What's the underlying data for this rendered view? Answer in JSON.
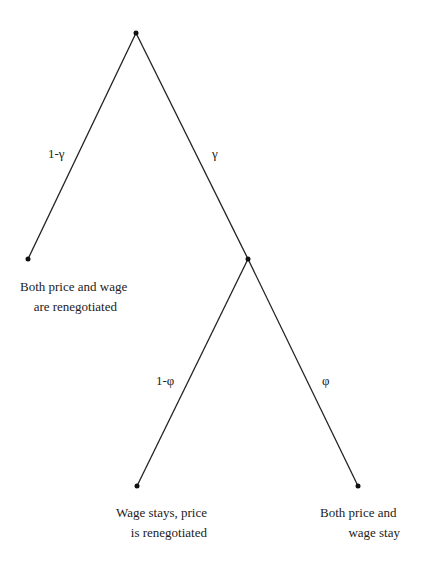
{
  "diagram": {
    "type": "probability-tree",
    "nodes": [
      {
        "id": "root",
        "x": 136,
        "y": 33
      },
      {
        "id": "leaf-both-renegotiated",
        "x": 28,
        "y": 259
      },
      {
        "id": "node-wage-fixed",
        "x": 248,
        "y": 259
      },
      {
        "id": "leaf-wage-stays",
        "x": 137,
        "y": 486
      },
      {
        "id": "leaf-both-stay",
        "x": 358,
        "y": 486
      }
    ],
    "edges": [
      {
        "from": "root",
        "to": "leaf-both-renegotiated",
        "label": "1-γ"
      },
      {
        "from": "root",
        "to": "node-wage-fixed",
        "label": "γ"
      },
      {
        "from": "node-wage-fixed",
        "to": "leaf-wage-stays",
        "label": "1-φ"
      },
      {
        "from": "node-wage-fixed",
        "to": "leaf-both-stay",
        "label": "φ"
      }
    ]
  },
  "labels": {
    "edge_one_minus_gamma": "1-γ",
    "edge_gamma": "γ",
    "edge_one_minus_phi": "1-φ",
    "edge_phi": "φ",
    "leaf_both_renegotiated_line1": "Both price and wage",
    "leaf_both_renegotiated_line2": "are renegotiated",
    "leaf_wage_stays_line1": "Wage stays, price",
    "leaf_wage_stays_line2": "is renegotiated",
    "leaf_both_stay_line1": "Both price and",
    "leaf_both_stay_line2": "wage stay"
  }
}
